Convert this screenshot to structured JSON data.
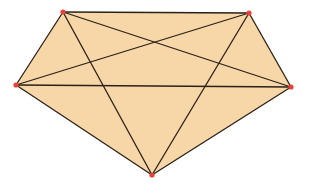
{
  "diagram": {
    "type": "complete-graph-pentagon",
    "fill_color": "#f7d6a8",
    "edge_color": "#2a2118",
    "vertex_color": "#e8403a",
    "vertices": [
      {
        "id": "A",
        "x": 63,
        "y": 12
      },
      {
        "id": "B",
        "x": 249,
        "y": 13
      },
      {
        "id": "C",
        "x": 291,
        "y": 87
      },
      {
        "id": "D",
        "x": 152,
        "y": 175
      },
      {
        "id": "E",
        "x": 16,
        "y": 85
      }
    ],
    "edges": [
      [
        "A",
        "B"
      ],
      [
        "B",
        "C"
      ],
      [
        "C",
        "D"
      ],
      [
        "D",
        "E"
      ],
      [
        "E",
        "A"
      ],
      [
        "A",
        "C"
      ],
      [
        "A",
        "D"
      ],
      [
        "B",
        "D"
      ],
      [
        "B",
        "E"
      ],
      [
        "C",
        "E"
      ]
    ]
  }
}
